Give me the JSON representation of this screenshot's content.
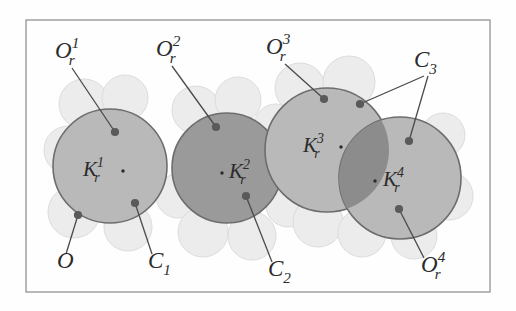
{
  "figure": {
    "type": "space-filling molecular sphere diagram",
    "frame": {
      "stroke": "#9a9a9a",
      "x": 26,
      "y": 20,
      "width": 464,
      "height": 272
    },
    "background": "#fefefe",
    "colors": {
      "sphere_light": "#b9b9b9",
      "sphere_dark": "#9a9a9a",
      "lens_overlap": "#8c8c8c",
      "lobe_pale": "#ececec",
      "outline": "#6d6d6d",
      "leader": "#4a4a4a",
      "dot": "#5a5a5a",
      "text": "#2b2b2b"
    },
    "spheres": [
      {
        "id": "K1",
        "label": "K",
        "sub": "r",
        "sup": "1",
        "cx": 110,
        "cy": 166,
        "r": 57,
        "fill": "#b9b9b9",
        "label_x": 83,
        "label_y": 176,
        "center_dot_x": 123,
        "center_dot_y": 171
      },
      {
        "id": "K2",
        "label": "K",
        "sub": "r",
        "sup": "2",
        "cx": 227,
        "cy": 168,
        "r": 55,
        "fill": "#9a9a9a",
        "label_x": 229,
        "label_y": 178,
        "center_dot_x": 222,
        "center_dot_y": 173
      },
      {
        "id": "K3",
        "label": "K",
        "sub": "r",
        "sup": "3",
        "cx": 327,
        "cy": 150,
        "r": 62,
        "fill": "#b9b9b9",
        "label_x": 303,
        "label_y": 152,
        "center_dot_x": 341,
        "center_dot_y": 147
      },
      {
        "id": "K4",
        "label": "K",
        "sub": "r",
        "sup": "4",
        "cx": 400,
        "cy": 178,
        "r": 61,
        "fill": "#b9b9b9",
        "label_x": 383,
        "label_y": 186,
        "center_dot_x": 375,
        "center_dot_y": 181
      }
    ],
    "lobes": [
      {
        "cx": 84,
        "cy": 104,
        "r": 25
      },
      {
        "cx": 125,
        "cy": 98,
        "r": 23
      },
      {
        "cx": 68,
        "cy": 150,
        "r": 24
      },
      {
        "cx": 74,
        "cy": 212,
        "r": 26
      },
      {
        "cx": 128,
        "cy": 227,
        "r": 24
      },
      {
        "cx": 178,
        "cy": 196,
        "r": 22
      },
      {
        "cx": 196,
        "cy": 110,
        "r": 24
      },
      {
        "cx": 238,
        "cy": 100,
        "r": 23
      },
      {
        "cx": 203,
        "cy": 232,
        "r": 25
      },
      {
        "cx": 252,
        "cy": 236,
        "r": 24
      },
      {
        "cx": 288,
        "cy": 205,
        "r": 22
      },
      {
        "cx": 300,
        "cy": 88,
        "r": 25
      },
      {
        "cx": 349,
        "cy": 82,
        "r": 26
      },
      {
        "cx": 276,
        "cy": 126,
        "r": 22
      },
      {
        "cx": 318,
        "cy": 222,
        "r": 25
      },
      {
        "cx": 362,
        "cy": 233,
        "r": 24
      },
      {
        "cx": 449,
        "cy": 196,
        "r": 24
      },
      {
        "cx": 443,
        "cy": 135,
        "r": 22
      },
      {
        "cx": 414,
        "cy": 236,
        "r": 23
      }
    ],
    "overlap_lens": {
      "sphere_a": "K3",
      "sphere_b": "K4",
      "fill": "#8c8c8c"
    },
    "labels": [
      {
        "id": "Or1",
        "base": "O",
        "sub": "r",
        "sup": "1",
        "x": 55,
        "y": 58,
        "leader": {
          "x1": 72,
          "y1": 68,
          "x2": 115,
          "y2": 132
        },
        "dot": {
          "x": 115,
          "y": 132
        }
      },
      {
        "id": "Or2",
        "base": "O",
        "sub": "r",
        "sup": "2",
        "x": 156,
        "y": 56,
        "leader": {
          "x1": 172,
          "y1": 66,
          "x2": 216,
          "y2": 127
        },
        "dot": {
          "x": 216,
          "y": 127
        }
      },
      {
        "id": "Or3",
        "base": "O",
        "sub": "r",
        "sup": "3",
        "x": 266,
        "y": 54,
        "leader": {
          "x1": 285,
          "y1": 64,
          "x2": 324,
          "y2": 99
        },
        "dot": {
          "x": 324,
          "y": 99
        }
      },
      {
        "id": "C3",
        "base": "C",
        "sub": "3",
        "sup": "",
        "x": 414,
        "y": 67,
        "leader": {
          "x1": 424,
          "y1": 76,
          "x2": 360,
          "y2": 104
        },
        "dot": {
          "x": 360,
          "y": 104
        },
        "leader2": {
          "x1": 428,
          "y1": 76,
          "x2": 409,
          "y2": 141
        },
        "dot2": {
          "x": 409,
          "y": 141
        }
      },
      {
        "id": "O",
        "base": "O",
        "sub": "",
        "sup": "",
        "x": 57,
        "y": 268,
        "leader": {
          "x1": 66,
          "y1": 254,
          "x2": 78,
          "y2": 215
        },
        "dot": {
          "x": 78,
          "y": 215
        }
      },
      {
        "id": "C1",
        "base": "C",
        "sub": "1",
        "sup": "",
        "x": 148,
        "y": 268,
        "leader": {
          "x1": 152,
          "y1": 254,
          "x2": 135,
          "y2": 203
        },
        "dot": {
          "x": 135,
          "y": 203
        }
      },
      {
        "id": "C2",
        "base": "C",
        "sub": "2",
        "sup": "",
        "x": 268,
        "y": 276,
        "leader": {
          "x1": 272,
          "y1": 262,
          "x2": 246,
          "y2": 196
        },
        "dot": {
          "x": 246,
          "y": 196
        }
      },
      {
        "id": "Or4",
        "base": "O",
        "sub": "r",
        "sup": "4",
        "x": 421,
        "y": 272,
        "leader": {
          "x1": 424,
          "y1": 258,
          "x2": 399,
          "y2": 209
        },
        "dot": {
          "x": 399,
          "y": 209
        }
      }
    ]
  }
}
